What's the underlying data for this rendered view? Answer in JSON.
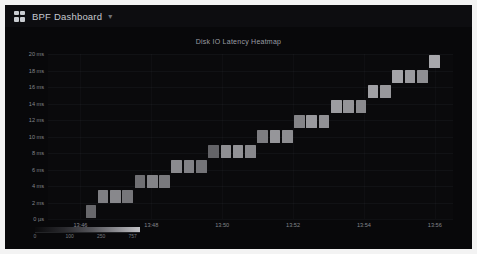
{
  "window": {
    "app_title": "BPF Dashboard",
    "title_caret": "▾",
    "grid_icon": "grid-icon"
  },
  "panel": {
    "title": "Disk IO Latency Heatmap"
  },
  "colors": {
    "page_background": "#f3f3f3",
    "app_background": "#070709",
    "header_background": "#0d0d10",
    "panel_background": "#08080a",
    "text_primary": "#c6c9cf",
    "text_muted": "#83868c",
    "cell_low": "#1d1d21",
    "cell_high": "#cfcfd3"
  },
  "chart_data": {
    "type": "heatmap",
    "title": "Disk IO Latency Heatmap",
    "xlabel": "",
    "ylabel": "",
    "grid": true,
    "legend_position": "bottom-left",
    "ylim": [
      0,
      20
    ],
    "y_unit": "ms",
    "y_ticks": [
      "0 µs",
      "2 ms",
      "4 ms",
      "6 ms",
      "8 ms",
      "10 ms",
      "12 ms",
      "14 ms",
      "16 ms",
      "18 ms",
      "20 ms"
    ],
    "y_tick_values": [
      0,
      2,
      4,
      6,
      8,
      10,
      12,
      14,
      16,
      18,
      20
    ],
    "x_ticks": [
      "13:46",
      "13:48",
      "13:50",
      "13:52",
      "13:54",
      "13:56"
    ],
    "x_tick_positions": [
      0.08,
      0.255,
      0.43,
      0.605,
      0.78,
      0.955
    ],
    "colorbar": {
      "gradient_stops": [
        "#0a0a0c",
        "#2a2a2e",
        "#57575c",
        "#8d8d92",
        "#c2c2c6"
      ],
      "ticks": [
        "0",
        "100",
        "250",
        "757"
      ],
      "tick_positions": [
        0.0,
        0.33,
        0.63,
        0.93
      ]
    },
    "cells": [
      {
        "col": 3,
        "row": 0,
        "v": 0.42
      },
      {
        "col": 4,
        "row": 1,
        "v": 0.55
      },
      {
        "col": 5,
        "row": 1,
        "v": 0.6
      },
      {
        "col": 6,
        "row": 1,
        "v": 0.5
      },
      {
        "col": 7,
        "row": 2,
        "v": 0.46
      },
      {
        "col": 8,
        "row": 2,
        "v": 0.58
      },
      {
        "col": 9,
        "row": 2,
        "v": 0.52
      },
      {
        "col": 10,
        "row": 3,
        "v": 0.62
      },
      {
        "col": 11,
        "row": 3,
        "v": 0.57
      },
      {
        "col": 12,
        "row": 3,
        "v": 0.49
      },
      {
        "col": 13,
        "row": 4,
        "v": 0.4
      },
      {
        "col": 14,
        "row": 4,
        "v": 0.64
      },
      {
        "col": 15,
        "row": 4,
        "v": 0.66
      },
      {
        "col": 16,
        "row": 4,
        "v": 0.6
      },
      {
        "col": 17,
        "row": 5,
        "v": 0.54
      },
      {
        "col": 18,
        "row": 5,
        "v": 0.68
      },
      {
        "col": 19,
        "row": 5,
        "v": 0.63
      },
      {
        "col": 20,
        "row": 6,
        "v": 0.58
      },
      {
        "col": 21,
        "row": 6,
        "v": 0.7
      },
      {
        "col": 22,
        "row": 6,
        "v": 0.65
      },
      {
        "col": 23,
        "row": 7,
        "v": 0.72
      },
      {
        "col": 24,
        "row": 7,
        "v": 0.67
      },
      {
        "col": 25,
        "row": 7,
        "v": 0.61
      },
      {
        "col": 26,
        "row": 8,
        "v": 0.74
      },
      {
        "col": 27,
        "row": 8,
        "v": 0.69
      },
      {
        "col": 28,
        "row": 9,
        "v": 0.76
      },
      {
        "col": 29,
        "row": 9,
        "v": 0.71
      },
      {
        "col": 30,
        "row": 9,
        "v": 0.64
      },
      {
        "col": 31,
        "row": 10,
        "v": 0.78
      }
    ],
    "n_cols": 33,
    "n_rows": 11
  }
}
